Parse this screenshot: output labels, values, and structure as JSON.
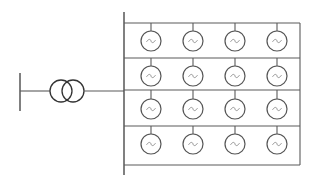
{
  "diagram": {
    "type": "single-line electrical diagram",
    "colors": {
      "line": "#5a5a5a",
      "bus": "#4a4a4a",
      "background": "#ffffff"
    },
    "grid_bus": {
      "x": 20,
      "y1": 73,
      "y2": 111
    },
    "transformer": {
      "symbol": "two-winding-transformer",
      "y": 91,
      "circle1_cx": 61,
      "circle2_cx": 73,
      "r": 11
    },
    "main_bus": {
      "x": 124,
      "y1": 12,
      "y2": 175
    },
    "feeder_lines_y": [
      23,
      58,
      90,
      126,
      165
    ],
    "right_edge_x": 300,
    "generator_symbol": "ac-generator-circle-tilde",
    "generator_columns_x": [
      151,
      193,
      235,
      277
    ],
    "generator_rows_y": [
      41,
      76,
      109,
      144
    ],
    "generator_radius": 10,
    "generator_count": 16
  }
}
